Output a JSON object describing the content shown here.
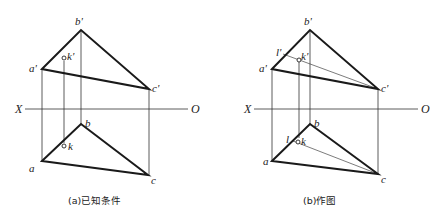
{
  "panels": [
    {
      "id": "a",
      "caption": "(a)已知条件",
      "axis": {
        "left_label": "X",
        "right_label": "O"
      },
      "labels": {
        "b_prime": "b'",
        "a_prime": "a'",
        "c_prime": "c'",
        "k_prime": "k'",
        "b": "b",
        "a": "a",
        "c": "c",
        "k": "k"
      }
    },
    {
      "id": "b",
      "caption": "(b)作图",
      "axis": {
        "left_label": "X",
        "right_label": "O"
      },
      "labels": {
        "b_prime": "b'",
        "a_prime": "a'",
        "c_prime": "c'",
        "k_prime": "k'",
        "l_prime": "l'",
        "b": "b",
        "a": "a",
        "c": "c",
        "k": "k",
        "l": "l"
      }
    }
  ]
}
